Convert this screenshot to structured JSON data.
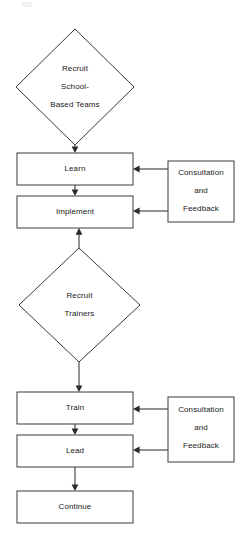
{
  "diagram": {
    "background_color": "#ffffff",
    "stroke_color": "#3a3a3a",
    "text_color": "#1a1a1a",
    "nodes": [
      {
        "id": "recruit-school-based-teams",
        "shape": "diamond",
        "lines": [
          "Recruit",
          "School-",
          "Based Teams"
        ]
      },
      {
        "id": "learn",
        "shape": "rectangle",
        "lines": [
          "Learn"
        ]
      },
      {
        "id": "implement",
        "shape": "rectangle",
        "lines": [
          "Implement"
        ]
      },
      {
        "id": "consultation-feedback-top",
        "shape": "rectangle",
        "lines": [
          "Consultation",
          "and",
          "Feedback"
        ]
      },
      {
        "id": "recruit-trainers",
        "shape": "diamond",
        "lines": [
          "Recruit",
          "Trainers"
        ]
      },
      {
        "id": "train",
        "shape": "rectangle",
        "lines": [
          "Train"
        ]
      },
      {
        "id": "lead",
        "shape": "rectangle",
        "lines": [
          "Lead"
        ]
      },
      {
        "id": "consultation-feedback-bottom",
        "shape": "rectangle",
        "lines": [
          "Consultation",
          "and",
          "Feedback"
        ]
      },
      {
        "id": "continue",
        "shape": "rectangle",
        "lines": [
          "Continue"
        ]
      }
    ],
    "edges": [
      {
        "from": "recruit-school-based-teams",
        "to": "learn",
        "direction": "down"
      },
      {
        "from": "learn",
        "to": "implement",
        "direction": "down"
      },
      {
        "from": "consultation-feedback-top",
        "to": "learn",
        "direction": "left"
      },
      {
        "from": "consultation-feedback-top",
        "to": "implement",
        "direction": "left"
      },
      {
        "from": "recruit-trainers",
        "to": "implement",
        "direction": "up"
      },
      {
        "from": "recruit-trainers",
        "to": "train",
        "direction": "down"
      },
      {
        "from": "train",
        "to": "lead",
        "direction": "down"
      },
      {
        "from": "consultation-feedback-bottom",
        "to": "train",
        "direction": "left"
      },
      {
        "from": "consultation-feedback-bottom",
        "to": "lead",
        "direction": "left"
      },
      {
        "from": "lead",
        "to": "continue",
        "direction": "down"
      }
    ]
  }
}
